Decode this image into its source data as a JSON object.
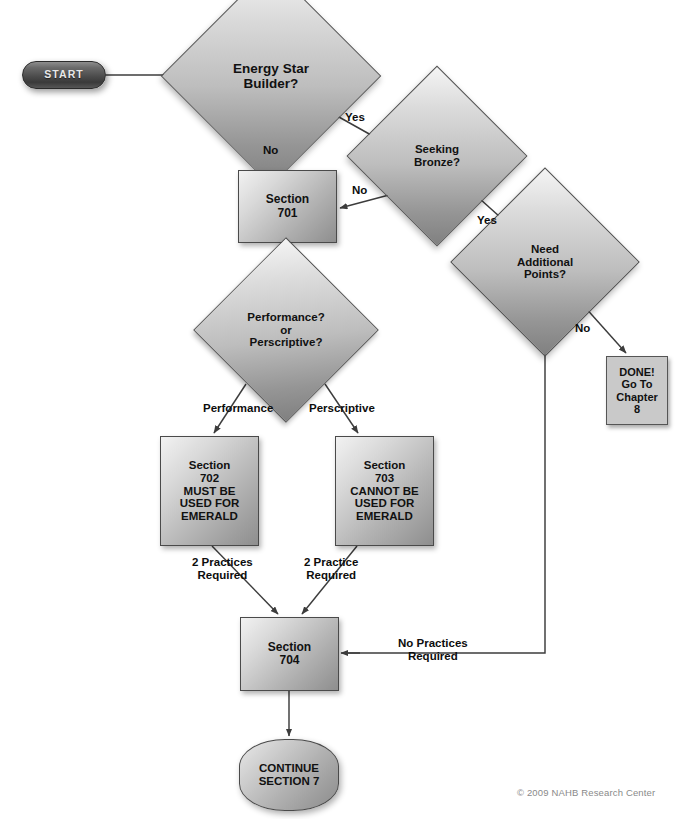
{
  "diagram": {
    "background": "#ffffff",
    "copyright": "© 2009 NAHB Research Center"
  },
  "nodes": {
    "start": {
      "label": "START",
      "shape": "terminator"
    },
    "energy_star": {
      "line1": "Energy Star",
      "line2": "Builder?",
      "shape": "decision"
    },
    "seeking_bronze": {
      "line1": "Seeking",
      "line2": "Bronze?",
      "shape": "decision"
    },
    "need_points": {
      "line1": "Need",
      "line2": "Additional",
      "line3": "Points?",
      "shape": "decision"
    },
    "section701": {
      "line1": "Section",
      "line2": "701",
      "shape": "process"
    },
    "done": {
      "line1": "DONE!",
      "line2": "Go To",
      "line3": "Chapter",
      "line4": "8",
      "shape": "process"
    },
    "perf_presc": {
      "line1": "Performance?",
      "line2": "or",
      "line3": "Perscriptive?",
      "shape": "decision"
    },
    "section702": {
      "line1": "Section",
      "line2": "702",
      "line3": "MUST BE",
      "line4": "USED FOR",
      "line5": "EMERALD",
      "shape": "process"
    },
    "section703": {
      "line1": "Section",
      "line2": "703",
      "line3": "CANNOT BE",
      "line4": "USED FOR",
      "line5": "EMERALD",
      "shape": "process"
    },
    "section704": {
      "line1": "Section",
      "line2": "704",
      "shape": "process"
    },
    "continue": {
      "line1": "CONTINUE",
      "line2": "SECTION 7",
      "shape": "terminator"
    }
  },
  "edge_labels": {
    "es_yes": "Yes",
    "es_no": "No",
    "sb_no": "No",
    "sb_yes": "Yes",
    "np_no": "No",
    "performance": "Performance",
    "perscriptive": "Perscriptive",
    "two_practices_required": "2 Practices\nRequired",
    "two_practice_required": "2 Practice\nRequired",
    "no_practices_required": "No Practices\nRequired"
  },
  "colors": {
    "page_background": "#ffffff",
    "shape_fill_light": "#f2f2f2",
    "shape_fill_dark": "#8e8e8e",
    "shape_stroke": "#4a4a4a",
    "start_fill": "#4c4c4c",
    "start_text": "#e8e8e8",
    "done_fill": "#c9c9c9",
    "text": "#111111",
    "connector": "#3c3c3c",
    "copyright_text": "#8a8a8a"
  }
}
